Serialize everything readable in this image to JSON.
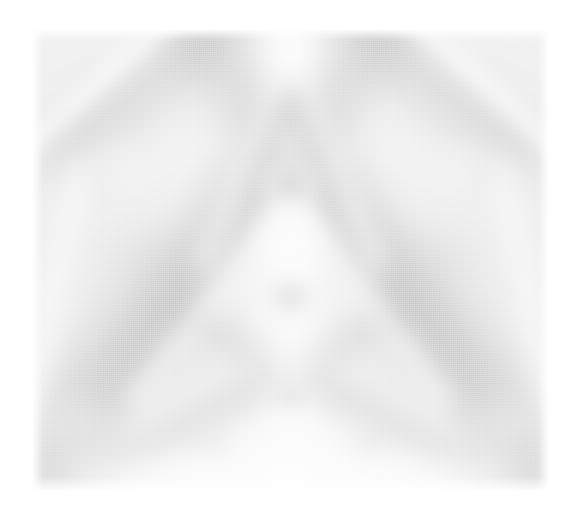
{
  "figure": {
    "kind": "scanned-grayscale-micrograph",
    "content_description": "Kikuchi diffraction pattern: broad low-contrast crossing bands converging on a zone axis near the upper centre, with mirror symmetry about the vertical centre line",
    "caption": "",
    "alt_text": "Low-contrast grayscale Kikuchi diffraction pattern with crossing diffuse bands"
  },
  "canvas": {
    "width": 578,
    "height": 517,
    "page_background": "#ffffff"
  },
  "plate": {
    "left": 33,
    "top": 30,
    "width": 515,
    "height": 460,
    "base_gray": "#e9e9e9",
    "darkest_gray": "#8f928f",
    "brightest_gray": "#ffffff",
    "texture": "halftone-dither"
  },
  "palette": {
    "background": "#ffffff",
    "field": "#e9e9e9",
    "band_dark": "#8f928f",
    "band_mid": "#a6a9a6",
    "band_light": "#ffffff",
    "zone_axis": "#8a8d8a"
  },
  "features": {
    "bands": [
      {
        "name": "upper-left-bright-ray",
        "cx": 11,
        "cy": 13,
        "len": 34,
        "thick": 5.0,
        "angle": 48,
        "tone": "bright",
        "opacity": 0.95
      },
      {
        "name": "upper-right-bright-ray",
        "cx": 89,
        "cy": 13,
        "len": 34,
        "thick": 5.0,
        "angle": -48,
        "tone": "bright",
        "opacity": 0.95
      },
      {
        "name": "upper-left-dark-wedge",
        "cx": 22,
        "cy": 12,
        "len": 40,
        "thick": 13,
        "angle": 52,
        "tone": "dark",
        "opacity": 0.62
      },
      {
        "name": "upper-right-dark-wedge",
        "cx": 78,
        "cy": 12,
        "len": 40,
        "thick": 13,
        "angle": -52,
        "tone": "dark",
        "opacity": 0.62
      },
      {
        "name": "major-diagonal-left",
        "cx": 34,
        "cy": 46,
        "len": 92,
        "thick": 15,
        "angle": 40,
        "tone": "dark",
        "opacity": 0.8
      },
      {
        "name": "major-diagonal-right",
        "cx": 66,
        "cy": 46,
        "len": 92,
        "thick": 15,
        "angle": -40,
        "tone": "dark",
        "opacity": 0.8
      },
      {
        "name": "secondary-diagonal-left",
        "cx": 26,
        "cy": 62,
        "len": 80,
        "thick": 11,
        "angle": 33,
        "tone": "dark",
        "opacity": 0.58
      },
      {
        "name": "secondary-diagonal-right",
        "cx": 74,
        "cy": 62,
        "len": 80,
        "thick": 11,
        "angle": -33,
        "tone": "dark",
        "opacity": 0.58
      },
      {
        "name": "lower-steep-left",
        "cx": 40,
        "cy": 80,
        "len": 60,
        "thick": 9,
        "angle": 62,
        "tone": "dark",
        "opacity": 0.5
      },
      {
        "name": "lower-steep-right",
        "cx": 60,
        "cy": 80,
        "len": 60,
        "thick": 9,
        "angle": -62,
        "tone": "dark",
        "opacity": 0.5
      },
      {
        "name": "centre-bright-column",
        "cx": 50,
        "cy": 68,
        "len": 70,
        "thick": 10,
        "angle": 0,
        "tone": "bright",
        "opacity": 0.88
      },
      {
        "name": "upper-bright-vee-left",
        "cx": 42,
        "cy": 26,
        "len": 40,
        "thick": 7,
        "angle": 22,
        "tone": "bright",
        "opacity": 0.7
      },
      {
        "name": "upper-bright-vee-right",
        "cx": 58,
        "cy": 26,
        "len": 40,
        "thick": 7,
        "angle": -22,
        "tone": "bright",
        "opacity": 0.7
      },
      {
        "name": "mid-bright-chevron-left",
        "cx": 37,
        "cy": 56,
        "len": 46,
        "thick": 6,
        "angle": 38,
        "tone": "bright",
        "opacity": 0.62
      },
      {
        "name": "mid-bright-chevron-right",
        "cx": 63,
        "cy": 56,
        "len": 46,
        "thick": 6,
        "angle": -38,
        "tone": "bright",
        "opacity": 0.62
      },
      {
        "name": "left-edge-bright",
        "cx": 3,
        "cy": 62,
        "len": 50,
        "thick": 7,
        "angle": 12,
        "tone": "bright",
        "opacity": 0.72
      },
      {
        "name": "right-edge-bright",
        "cx": 97,
        "cy": 62,
        "len": 50,
        "thick": 7,
        "angle": -12,
        "tone": "bright",
        "opacity": 0.72
      },
      {
        "name": "bottom-bright-band",
        "cx": 50,
        "cy": 97,
        "len": 70,
        "thick": 9,
        "angle": 90,
        "tone": "bright",
        "opacity": 0.8
      }
    ],
    "blobs": [
      {
        "name": "primary-zone-axis",
        "cx": 50,
        "cy": 34,
        "rx": 5.0,
        "ry": 4.0,
        "tone": "dark",
        "opacity": 0.85
      },
      {
        "name": "secondary-zone-axis",
        "cx": 50,
        "cy": 58,
        "rx": 4.5,
        "ry": 4.0,
        "tone": "dark",
        "opacity": 0.62
      },
      {
        "name": "lower-zone-node",
        "cx": 50,
        "cy": 80,
        "rx": 4.0,
        "ry": 3.2,
        "tone": "dark",
        "opacity": 0.45
      },
      {
        "name": "left-diffuse-patch",
        "cx": 21,
        "cy": 50,
        "rx": 11,
        "ry": 11,
        "tone": "mid",
        "opacity": 0.55
      },
      {
        "name": "right-diffuse-patch",
        "cx": 79,
        "cy": 50,
        "rx": 11,
        "ry": 11,
        "tone": "mid",
        "opacity": 0.55
      },
      {
        "name": "lower-left-patch",
        "cx": 27,
        "cy": 73,
        "rx": 12,
        "ry": 10,
        "tone": "mid",
        "opacity": 0.48
      },
      {
        "name": "lower-right-patch",
        "cx": 73,
        "cy": 73,
        "rx": 12,
        "ry": 10,
        "tone": "mid",
        "opacity": 0.48
      },
      {
        "name": "bottom-left-node",
        "cx": 35,
        "cy": 91,
        "rx": 5,
        "ry": 4,
        "tone": "mid",
        "opacity": 0.45
      },
      {
        "name": "bottom-right-node",
        "cx": 65,
        "cy": 91,
        "rx": 5,
        "ry": 4,
        "tone": "mid",
        "opacity": 0.45
      },
      {
        "name": "central-bright-eye",
        "cx": 50,
        "cy": 46,
        "rx": 8,
        "ry": 7,
        "tone": "light",
        "opacity": 0.92
      },
      {
        "name": "mid-bright-lozenge",
        "cx": 50,
        "cy": 69,
        "rx": 10,
        "ry": 9,
        "tone": "light",
        "opacity": 0.8
      },
      {
        "name": "top-bright-dome",
        "cx": 50,
        "cy": 6,
        "rx": 14,
        "ry": 7,
        "tone": "light",
        "opacity": 0.85
      },
      {
        "name": "bottom-bright-dome",
        "cx": 50,
        "cy": 99,
        "rx": 18,
        "ry": 8,
        "tone": "light",
        "opacity": 0.9
      },
      {
        "name": "upper-left-highlight",
        "cx": 16,
        "cy": 28,
        "rx": 7,
        "ry": 6,
        "tone": "light",
        "opacity": 0.55
      },
      {
        "name": "upper-right-highlight",
        "cx": 84,
        "cy": 28,
        "rx": 7,
        "ry": 6,
        "tone": "light",
        "opacity": 0.55
      },
      {
        "name": "left-bottom-highlight",
        "cx": 8,
        "cy": 86,
        "rx": 9,
        "ry": 8,
        "tone": "light",
        "opacity": 0.7
      },
      {
        "name": "right-bottom-highlight",
        "cx": 92,
        "cy": 86,
        "rx": 9,
        "ry": 8,
        "tone": "light",
        "opacity": 0.7
      }
    ]
  }
}
